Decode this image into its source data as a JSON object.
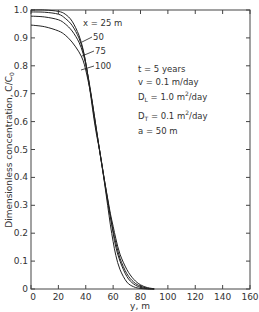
{
  "chart_data": {
    "type": "line",
    "title": "",
    "xlabel": "y, m",
    "ylabel": "Dimensionless concentration, C/C0",
    "xlim": [
      0,
      160
    ],
    "ylim": [
      0,
      1.0
    ],
    "xticks": [
      0,
      20,
      40,
      60,
      80,
      100,
      120,
      140,
      160
    ],
    "yticks": [
      0,
      0.1,
      0.2,
      0.3,
      0.4,
      0.5,
      0.6,
      0.7,
      0.8,
      0.9,
      1.0
    ],
    "grid": false,
    "legend_position": "inline labels near curves, upper middle",
    "x": [
      0,
      10,
      20,
      25,
      30,
      35,
      38,
      40,
      42,
      44,
      46,
      48,
      50,
      52,
      54,
      56,
      58,
      60,
      62,
      65,
      70,
      75,
      80,
      85,
      90
    ],
    "series": [
      {
        "name": "x = 25 m",
        "values": [
          1.0,
          1.0,
          0.995,
          0.985,
          0.96,
          0.91,
          0.86,
          0.81,
          0.75,
          0.68,
          0.61,
          0.55,
          0.5,
          0.44,
          0.37,
          0.3,
          0.23,
          0.17,
          0.12,
          0.07,
          0.025,
          0.008,
          0.002,
          0.0,
          0.0
        ]
      },
      {
        "name": "x = 50 m",
        "values": [
          0.993,
          0.992,
          0.985,
          0.97,
          0.945,
          0.9,
          0.855,
          0.81,
          0.75,
          0.69,
          0.62,
          0.56,
          0.5,
          0.44,
          0.38,
          0.32,
          0.26,
          0.2,
          0.15,
          0.1,
          0.045,
          0.018,
          0.006,
          0.001,
          0.0
        ]
      },
      {
        "name": "x = 75 m",
        "values": [
          0.978,
          0.975,
          0.965,
          0.95,
          0.925,
          0.885,
          0.845,
          0.805,
          0.755,
          0.695,
          0.63,
          0.565,
          0.5,
          0.435,
          0.375,
          0.315,
          0.26,
          0.21,
          0.165,
          0.11,
          0.055,
          0.025,
          0.01,
          0.003,
          0.0
        ]
      },
      {
        "name": "x = 100 m",
        "values": [
          0.946,
          0.94,
          0.925,
          0.91,
          0.885,
          0.85,
          0.82,
          0.785,
          0.74,
          0.69,
          0.63,
          0.565,
          0.5,
          0.44,
          0.38,
          0.325,
          0.27,
          0.225,
          0.18,
          0.125,
          0.07,
          0.035,
          0.015,
          0.005,
          0.001
        ]
      }
    ],
    "annotations": [
      "t = 5 years",
      "v = 0.1 m/day",
      "DL = 1.0 m2/day",
      "DT = 0.1 m2/day",
      "a = 50 m"
    ]
  },
  "axes": {
    "xlabel": "y, m",
    "ylabel": "Dimensionless concentration, C/C",
    "ylabel_sub": "0",
    "x_tick_labels": [
      "0",
      "20",
      "40",
      "60",
      "80",
      "100",
      "120",
      "140",
      "160"
    ],
    "y_tick_labels": [
      "0",
      "0.1",
      "0.2",
      "0.3",
      "0.4",
      "0.5",
      "0.6",
      "0.7",
      "0.8",
      "0.9",
      "1.0"
    ]
  },
  "curve_labels": [
    "x = 25 m",
    "50",
    "75",
    "100"
  ],
  "params": {
    "t": "t = 5 years",
    "v": "v = 0.1 m/day",
    "dl_prefix": "D",
    "dl_sub": "L",
    "dl_value": " = 1.0 m",
    "dl_sup": "2",
    "dl_unit": "/day",
    "dt_prefix": "D",
    "dt_sub": "T",
    "dt_value": " = 0.1 m",
    "dt_sup": "2",
    "dt_unit": "/day",
    "a": "a = 50 m"
  }
}
